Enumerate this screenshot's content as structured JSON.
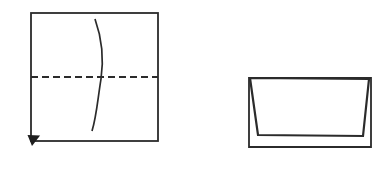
{
  "figure": {
    "canvas": {
      "width": 388,
      "height": 169,
      "background": "#ffffff"
    },
    "ink_color": "#2b2b2b",
    "paper_color": "#ffffff",
    "panels": [
      {
        "id": "unfolded-sheet",
        "label": "Unfolded square sheet with fold line and curved crease",
        "elements": [
          "square-outline",
          "horizontal-dashed-fold-line",
          "curved-crease-line",
          "corner-arrow-marker"
        ]
      },
      {
        "id": "folded-card",
        "label": "Resulting folded card seen in perspective",
        "elements": [
          "back-panel-outline",
          "front-flap-face"
        ]
      }
    ],
    "geometry": {
      "square": {
        "x": 31,
        "y": 13,
        "width": 127,
        "height": 128,
        "stroke_width": 1.8
      },
      "dashed_fold_line": {
        "y": 77,
        "x_start": 31,
        "x_end": 158,
        "dash_length": 7,
        "gap_length": 4,
        "stroke_width": 1.8
      },
      "curved_crease": {
        "x_top": 95,
        "y_top": 19,
        "x_mid": 101,
        "y_mid": 77,
        "x_bottom": 92,
        "y_bottom": 131,
        "stroke_width": 1.7
      },
      "corner_arrow": {
        "tip_x": 32,
        "tip_y": 146,
        "width": 9,
        "height": 11
      },
      "back_panel": {
        "points": "249,78 371,78 371,147 249,147",
        "stroke_width": 1.8
      },
      "front_flap": {
        "points": "250,78 369,79 363,136 258,135",
        "stroke_width": 2.2
      }
    }
  }
}
